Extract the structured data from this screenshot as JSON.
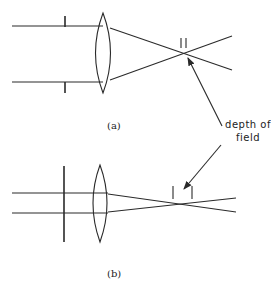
{
  "diagram": {
    "panels": [
      {
        "id": "a",
        "label": "(a)",
        "aperture": "wide",
        "depth_of_field": "small"
      },
      {
        "id": "b",
        "label": "(b)",
        "aperture": "narrow",
        "depth_of_field": "large"
      }
    ],
    "annotation": {
      "line1": "depth of",
      "line2": "field"
    },
    "colors": {
      "stroke": "#2a2a2a",
      "background": "#ffffff"
    }
  }
}
